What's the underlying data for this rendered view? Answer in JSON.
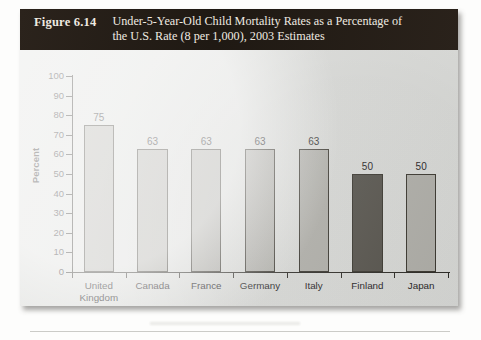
{
  "figure": {
    "number_label": "Figure 6.14",
    "caption_line_1": "Under-5-Year-Old Child Mortality Rates as a Percentage of",
    "caption_line_2": "the U.S. Rate (8 per 1,000), 2003 Estimates"
  },
  "colors": {
    "caption_bar": "#241d17",
    "caption_text": "#efeae1",
    "panel_background": "#dddedb",
    "bar_default": "#b3b2ac",
    "bar_highlight": "#57544d",
    "axis": "#2d2b26",
    "text": "#26241f"
  },
  "chart_data": {
    "type": "bar",
    "title": "Under-5-Year-Old Child Mortality Rates as a Percentage of the U.S. Rate (8 per 1,000), 2003 Estimates",
    "xlabel": "",
    "ylabel": "Percent",
    "ylim": [
      0,
      100
    ],
    "yticks": [
      0,
      10,
      20,
      30,
      40,
      50,
      60,
      70,
      80,
      90,
      100
    ],
    "ytick_labels": [
      "0",
      "10",
      "20",
      "30",
      "40",
      "50",
      "60",
      "70",
      "80",
      "90",
      "100"
    ],
    "grid": false,
    "legend": "none",
    "categories": [
      "United Kingdom",
      "Canada",
      "France",
      "Germany",
      "Italy",
      "Finland",
      "Japan"
    ],
    "category_lines": [
      [
        "United",
        "Kingdom"
      ],
      [
        "Canada"
      ],
      [
        "France"
      ],
      [
        "Germany"
      ],
      [
        "Italy"
      ],
      [
        "Finland"
      ],
      [
        "Japan"
      ]
    ],
    "values": [
      75,
      63,
      63,
      63,
      63,
      50,
      50
    ],
    "value_labels": [
      "75",
      "63",
      "63",
      "63",
      "63",
      "50",
      "50"
    ],
    "bar_colors": [
      "#b3b2ac",
      "#b3b2ac",
      "#b3b2ac",
      "#b3b2ac",
      "#b3b2ac",
      "#57544d",
      "#b3b2ac"
    ],
    "highlight_category": "Finland"
  }
}
